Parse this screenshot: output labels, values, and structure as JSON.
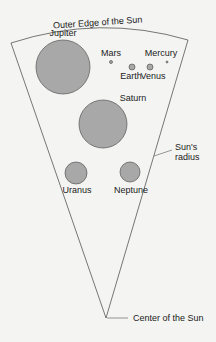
{
  "diagram": {
    "labels": {
      "outer_edge": "Outer Edge of the Sun",
      "center": "Center of the Sun",
      "radius_line1": "Sun's",
      "radius_line2": "radius"
    },
    "planets": [
      {
        "name": "Jupiter",
        "cx": 63,
        "cy": 67,
        "r": 27,
        "lx": 63,
        "ly": 36
      },
      {
        "name": "Mars",
        "cx": 111,
        "cy": 62,
        "r": 1.5,
        "lx": 111,
        "ly": 56
      },
      {
        "name": "Mercury",
        "cx": 167,
        "cy": 62,
        "r": 1,
        "lx": 161,
        "ly": 56
      },
      {
        "name": "Earth",
        "cx": 132,
        "cy": 67,
        "r": 3,
        "lx": 131,
        "ly": 79
      },
      {
        "name": "Venus",
        "cx": 150,
        "cy": 67,
        "r": 3,
        "lx": 153,
        "ly": 79
      },
      {
        "name": "Saturn",
        "cx": 103,
        "cy": 124,
        "r": 24,
        "lx": 133,
        "ly": 101
      },
      {
        "name": "Uranus",
        "cx": 76,
        "cy": 173,
        "r": 11,
        "lx": 77,
        "ly": 193
      },
      {
        "name": "Neptune",
        "cx": 130,
        "cy": 172,
        "r": 10,
        "lx": 131,
        "ly": 193
      }
    ],
    "colors": {
      "planet_fill": "#a8a8a8",
      "stroke": "#555555",
      "text": "#222222"
    }
  }
}
